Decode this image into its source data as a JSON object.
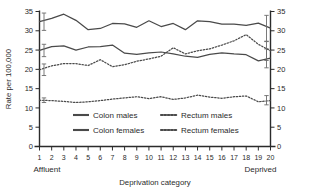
{
  "chart_data": {
    "type": "line",
    "title": "",
    "xlabel": "Deprivation category",
    "ylabel": "Rate per 100,000",
    "categories": [
      1,
      2,
      3,
      4,
      5,
      6,
      7,
      8,
      9,
      10,
      11,
      12,
      13,
      14,
      15,
      16,
      17,
      18,
      19,
      20
    ],
    "ylim": [
      0,
      35
    ],
    "ytick_values": [
      0,
      5,
      10,
      15,
      20,
      25,
      30,
      35
    ],
    "grid": false,
    "legend_position": "inside-bottom-center",
    "x_axis_end_labels": {
      "left": "Affluent",
      "right": "Deprived"
    },
    "dual_y_axis": true,
    "series": [
      {
        "name": "Colon males",
        "style": "solid",
        "values": [
          32.4,
          33.2,
          34.3,
          32.7,
          30.3,
          30.6,
          31.9,
          31.8,
          30.9,
          32.6,
          31.1,
          31.9,
          30.3,
          32.6,
          32.4,
          31.7,
          31.7,
          31.4,
          32.0,
          30.7
        ],
        "error_bars": [
          {
            "category": 1,
            "low": 30.1,
            "high": 34.6
          },
          {
            "category": 20,
            "low": 27.3,
            "high": 34.0
          }
        ]
      },
      {
        "name": "Colon females",
        "style": "solid",
        "values": [
          24.9,
          25.9,
          26.1,
          25.0,
          25.8,
          25.9,
          26.3,
          24.2,
          23.9,
          24.3,
          24.5,
          24.0,
          23.4,
          23.1,
          23.9,
          24.3,
          24.0,
          23.8,
          22.2,
          22.9
        ],
        "error_bars": [
          {
            "category": 1,
            "low": 23.3,
            "high": 26.5
          },
          {
            "category": 20,
            "low": 20.4,
            "high": 25.3
          }
        ]
      },
      {
        "name": "Rectum males",
        "style": "dotted",
        "values": [
          19.9,
          20.9,
          21.5,
          21.5,
          21.0,
          22.5,
          20.7,
          21.2,
          22.1,
          22.7,
          23.4,
          25.6,
          24.0,
          24.8,
          25.3,
          26.3,
          27.4,
          29.0,
          26.5,
          24.8
        ],
        "error_bars": [
          {
            "category": 1,
            "low": 18.4,
            "high": 21.4
          },
          {
            "category": 20,
            "low": 22.3,
            "high": 27.2
          }
        ]
      },
      {
        "name": "Rectum females",
        "style": "dotted",
        "values": [
          12.0,
          11.9,
          11.7,
          11.4,
          11.6,
          11.9,
          12.3,
          12.6,
          12.9,
          12.4,
          12.9,
          12.2,
          12.6,
          13.3,
          12.8,
          12.5,
          12.9,
          13.1,
          11.6,
          11.9
        ],
        "error_bars": [
          {
            "category": 1,
            "low": 11.4,
            "high": 12.6
          },
          {
            "category": 20,
            "low": 10.8,
            "high": 13.2
          }
        ]
      }
    ]
  },
  "legend": {
    "items": [
      {
        "label": "Colon males",
        "style": "solid"
      },
      {
        "label": "Rectum males",
        "style": "dotted"
      },
      {
        "label": "Colon females",
        "style": "solid"
      },
      {
        "label": "Rectum females",
        "style": "dotted"
      }
    ]
  },
  "axes": {
    "y_title": "Rate per 100,000",
    "x_title": "Deprivation category",
    "left_ticks": [
      "35",
      "30",
      "25",
      "20",
      "15",
      "10",
      "5",
      "0"
    ],
    "right_ticks": [
      "35",
      "30",
      "25",
      "20",
      "15",
      "10",
      "5",
      "0"
    ],
    "x_ticks": [
      "1",
      "2",
      "3",
      "4",
      "5",
      "6",
      "7",
      "8",
      "9",
      "10",
      "11",
      "12",
      "13",
      "14",
      "15",
      "16",
      "17",
      "18",
      "19",
      "20"
    ],
    "affluent_label": "Affluent",
    "deprived_label": "Deprived"
  },
  "colors": {
    "axis": "#2b2b2b",
    "series": "#4a4a4a",
    "error_bar": "#6b6b6b",
    "background": "#ffffff"
  }
}
